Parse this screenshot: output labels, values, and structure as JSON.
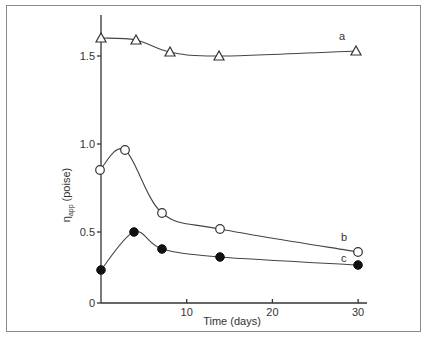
{
  "chart_data": {
    "type": "line",
    "title": "",
    "xlabel": "Time (days)",
    "ylabel": "η_app (poise)",
    "ylabel_main": "η",
    "ylabel_sub": "app",
    "ylabel_unit": "(poise)",
    "xlim": [
      0,
      31
    ],
    "ylim": [
      0,
      1.8
    ],
    "grid": false,
    "legend": "inline labels at curve ends",
    "x_ticks": [
      {
        "value": 10,
        "label": "10"
      },
      {
        "value": 20,
        "label": "20"
      },
      {
        "value": 30,
        "label": "30"
      }
    ],
    "y_ticks": [
      {
        "value": 0,
        "label": "0"
      },
      {
        "value": 0.5,
        "label": "0.5"
      },
      {
        "value": 1.0,
        "label": "1.0"
      },
      {
        "value": 1.5,
        "label": "1.5"
      }
    ],
    "series": [
      {
        "name": "a",
        "marker": "open-triangle",
        "x": [
          0,
          4,
          8,
          14,
          30
        ],
        "values": [
          1.6,
          1.59,
          1.52,
          1.5,
          1.53
        ]
      },
      {
        "name": "b",
        "marker": "open-circle",
        "x": [
          0,
          3,
          7,
          14,
          30
        ],
        "values": [
          0.85,
          0.97,
          0.6,
          0.5,
          0.35
        ]
      },
      {
        "name": "c",
        "marker": "filled-circle",
        "x": [
          0,
          4,
          7,
          14,
          30
        ],
        "values": [
          0.43,
          0.48,
          0.37,
          0.32,
          0.27
        ]
      }
    ]
  },
  "px": {
    "x0": 101,
    "x_per_day": 8.57,
    "y_ticks_px": {
      "0": 303,
      "0.5": 232,
      "1.0": 144,
      "1.5": 56
    },
    "points": {
      "a": [
        [
          101,
          38
        ],
        [
          136,
          40
        ],
        [
          170,
          52
        ],
        [
          219,
          56
        ],
        [
          356,
          51
        ]
      ],
      "b": [
        [
          100,
          170
        ],
        [
          125,
          150
        ],
        [
          162,
          213
        ],
        [
          220,
          229
        ],
        [
          358,
          252
        ]
      ],
      "c": [
        [
          101,
          270
        ],
        [
          134,
          232
        ],
        [
          162,
          249
        ],
        [
          220,
          257
        ],
        [
          358,
          265
        ]
      ]
    },
    "labels": {
      "a": [
        339,
        40
      ],
      "b": [
        341,
        241
      ],
      "c": [
        341,
        262
      ]
    }
  }
}
